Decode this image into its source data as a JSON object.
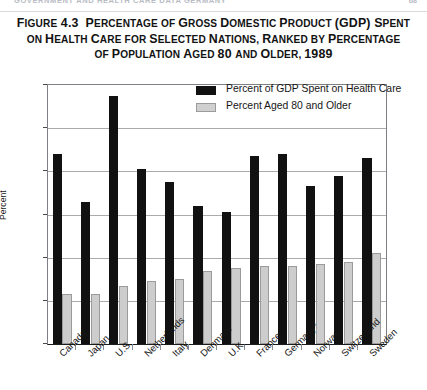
{
  "running_head": {
    "text": "GOVERNMENT AND HEALTH CARE DATA   GERMANY",
    "page_number": "68"
  },
  "title": {
    "label": "FIGURE 4.3",
    "line1": "FIGURE 4.3  PERCENTAGE OF GROSS DOMESTIC PRODUCT (GDP) SPENT",
    "line2": "ON HEALTH CARE FOR SELECTED NATIONS, RANKED BY PERCENTAGE",
    "line3": "OF POPULATION AGED 80 AND OLDER, 1989"
  },
  "chart_data": {
    "type": "bar",
    "title": "Percentage of Gross Domestic Product (GDP) Spent on Health Care for Selected Nations, Ranked by Percentage of Population Aged 80 and Older, 1989",
    "xlabel": "",
    "ylabel": "Percent",
    "ylim": [
      0,
      12
    ],
    "yticks": [
      0,
      2,
      4,
      6,
      8,
      10,
      12
    ],
    "grid": true,
    "legend_position": "top-right",
    "categories": [
      "Canada",
      "Japan",
      "U.S.",
      "Netherlands",
      "Italy",
      "Denmark",
      "U.K.",
      "France",
      "Germany*",
      "Norway",
      "Switzerland",
      "Sweden"
    ],
    "series": [
      {
        "name": "Percent of GDP Spent on Health Care",
        "color": "#111111",
        "values": [
          8.8,
          6.6,
          11.5,
          8.1,
          7.5,
          6.4,
          6.1,
          8.7,
          8.8,
          7.3,
          7.8,
          8.6
        ]
      },
      {
        "name": "Percent Aged 80 and Older",
        "color": "#cccdcc",
        "values": [
          2.3,
          2.3,
          2.7,
          2.9,
          3.0,
          3.4,
          3.5,
          3.6,
          3.6,
          3.7,
          3.8,
          4.2
        ]
      }
    ]
  },
  "legend": {
    "items": [
      {
        "label": "Percent of GDP Spent on Health Care",
        "swatch": "dark"
      },
      {
        "label": "Percent Aged 80 and Older",
        "swatch": "light"
      }
    ]
  }
}
